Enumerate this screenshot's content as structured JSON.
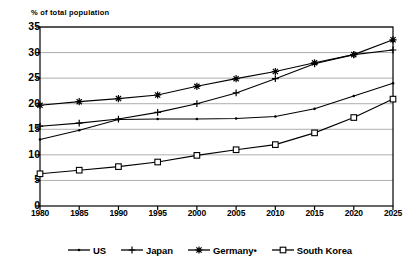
{
  "chart_data": {
    "type": "line",
    "title": "% of total population",
    "xlabel": "",
    "ylabel": "",
    "ylim": [
      0,
      35
    ],
    "ytick_values": [
      0,
      5,
      10,
      15,
      20,
      25,
      30,
      35
    ],
    "ytick_labels": [
      "0",
      "5",
      "10",
      "15",
      "20",
      "25",
      "30",
      "35"
    ],
    "grid": true,
    "grid_axis": "y",
    "legend_position": "bottom",
    "categories": [
      "1980",
      "1985",
      "1990",
      "1995",
      "2000",
      "2005",
      "2010",
      "2015",
      "2020",
      "2025"
    ],
    "x": [
      1980,
      1985,
      1990,
      1995,
      2000,
      2005,
      2010,
      2015,
      2020,
      2025
    ],
    "series": [
      {
        "name": "US",
        "marker": "dot",
        "values": [
          13.0,
          14.8,
          16.9,
          17.0,
          17.0,
          17.1,
          17.5,
          19.0,
          21.5,
          24.0
        ]
      },
      {
        "name": "Japan",
        "marker": "plus",
        "values": [
          15.6,
          16.2,
          17.0,
          18.3,
          20.0,
          22.1,
          24.9,
          27.8,
          29.6,
          30.5
        ]
      },
      {
        "name": "Germany•",
        "marker": "star",
        "values": [
          19.7,
          20.4,
          21.0,
          21.7,
          23.4,
          24.9,
          26.3,
          28.0,
          29.6,
          32.5
        ]
      },
      {
        "name": "South Korea",
        "marker": "square",
        "values": [
          6.3,
          7.0,
          7.7,
          8.6,
          9.9,
          11.0,
          12.0,
          14.3,
          17.3,
          20.9
        ]
      }
    ]
  },
  "legend": {
    "items": [
      {
        "label": "US",
        "marker": "dot"
      },
      {
        "label": "Japan",
        "marker": "plus"
      },
      {
        "label": "Germany•",
        "marker": "star"
      },
      {
        "label": "South Korea",
        "marker": "square"
      }
    ]
  }
}
